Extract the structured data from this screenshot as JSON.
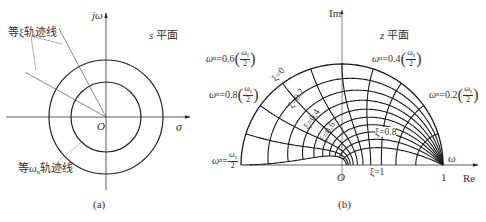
{
  "panel_a": {
    "caption": "(a)",
    "plane_label": "s 平面",
    "plane_label_var": "s",
    "plane_label_text": "平面",
    "imag_axis_label": "jω",
    "real_axis_label": "σ",
    "origin_label": "O",
    "const_zeta_label": "等ξ轨迹线",
    "const_wn_label": "等ωn轨迹线",
    "const_wn_prefix": "等",
    "const_wn_symbol": "ω",
    "const_wn_sub": "n",
    "const_wn_suffix": "轨迹线",
    "geometry": {
      "origin": [
        106,
        117
      ],
      "outer_radius": 57,
      "inner_radius": 35,
      "imag_axis_y": [
        13,
        190
      ],
      "real_axis_x": [
        6,
        190
      ],
      "zeta_ray_angles_deg": [
        118,
        151
      ],
      "zeta_ray_length": 98
    }
  },
  "panel_b": {
    "caption": "(b)",
    "plane_label_var": "z",
    "plane_label_text": "平面",
    "imag_axis_label": "Im",
    "real_axis_label": "Re",
    "origin_label": "O",
    "unit_point_label": "1",
    "omega_label": "ω",
    "geometry": {
      "origin": [
        342,
        165
      ],
      "unit_radius": 101,
      "imag_axis_y": [
        10,
        180
      ],
      "real_axis_x": [
        250,
        478
      ]
    },
    "zeta_values": [
      0,
      0.2,
      0.4,
      0.6,
      0.8,
      1.0
    ],
    "zeta_curves_extra": [
      0.1,
      0.3,
      0.5,
      0.7,
      0.9
    ],
    "wn_fractions": [
      0.1,
      0.2,
      0.3,
      0.4,
      0.5,
      0.6,
      0.7,
      0.8,
      0.9,
      1.0
    ],
    "wn_labels": [
      {
        "prefix": "ω",
        "sub": "n",
        "eq": "=0.6",
        "num": "ωs",
        "den": "2",
        "pos": [
          206,
          57
        ]
      },
      {
        "prefix": "ω",
        "sub": "n",
        "eq": "=0.4",
        "num": "ωs",
        "den": "2",
        "pos": [
          372,
          57
        ]
      },
      {
        "prefix": "ω",
        "sub": "n",
        "eq": "=0.8",
        "num": "ωs",
        "den": "2",
        "pos": [
          209,
          93
        ]
      },
      {
        "prefix": "ω",
        "sub": "n",
        "eq": "=0.2",
        "num": "ωs",
        "den": "2",
        "pos": [
          429,
          93
        ]
      },
      {
        "prefix": "ω",
        "sub": "n",
        "eq": "=",
        "num": "ωs",
        "den": "2",
        "pos": [
          212,
          159
        ],
        "plain": true
      }
    ],
    "zeta_labels": [
      {
        "text": "ξ=0",
        "pos": [
          274,
          81
        ],
        "rot": -52
      },
      {
        "text": "ξ=0.2",
        "pos": [
          290,
          108
        ],
        "rot": -55
      },
      {
        "text": "ξ=0.4",
        "pos": [
          306,
          129
        ],
        "rot": -57
      },
      {
        "text": "ξ=0.6",
        "pos": [
          322,
          142
        ],
        "rot": -60
      },
      {
        "text": "ξ=0.8",
        "pos": [
          375,
          133
        ],
        "rot": 0
      },
      {
        "text": "ξ=1",
        "pos": [
          370,
          173
        ],
        "rot": 0
      }
    ]
  }
}
